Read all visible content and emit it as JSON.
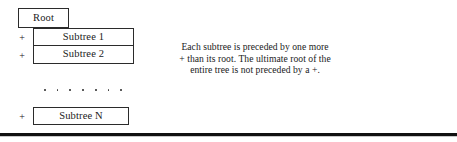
{
  "figure": {
    "diagram": {
      "root": {
        "label": "Root"
      },
      "subtrees": [
        {
          "plus": "+",
          "label": "Subtree 1"
        },
        {
          "plus": "+",
          "label": "Subtree 2"
        }
      ],
      "ellipsis_dot_count": 7,
      "last_subtree": {
        "plus": "+",
        "label": "Subtree N"
      }
    },
    "caption": {
      "lines": [
        "Each subtree is preceded by one more",
        "+ than its root. The ultimate root of the",
        "entire tree is not preceded by a +."
      ]
    },
    "colors": {
      "box_border": "#2b2b2b",
      "text": "#1a1a1a",
      "rule": "#111111",
      "page_background": "#ffffff"
    }
  }
}
